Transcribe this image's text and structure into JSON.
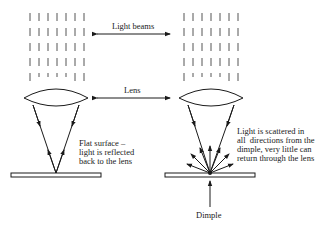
{
  "labels": {
    "light_beams": "Light beams",
    "lens": "Lens",
    "flat_surface": "Flat surface –\nlight is reflected\nback to the lens",
    "scattered": "Light is scattered in\nall  directions from the\ndimple, very little can\nreturn through the lens",
    "dimple": "Dimple"
  },
  "colors": {
    "line": "#1a1a1a",
    "beam": "#555555",
    "background": "#ffffff"
  },
  "panels": [
    {
      "name": "flat-surface-case",
      "beam_columns": 7,
      "lens_center_x": 56
    },
    {
      "name": "dimple-case",
      "beam_columns": 7,
      "lens_center_x": 211
    }
  ]
}
